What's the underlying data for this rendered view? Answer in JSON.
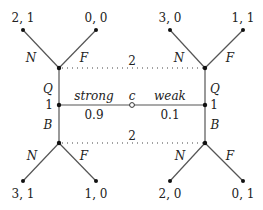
{
  "diagram": {
    "type": "extensive-form game tree",
    "nature": {
      "label": "c",
      "moves": [
        {
          "label": "strong",
          "probability": "0.9"
        },
        {
          "label": "weak",
          "probability": "0.1"
        }
      ]
    },
    "player1_nodes": [
      {
        "side": "left",
        "player": "1",
        "actions": [
          "Q",
          "B"
        ]
      },
      {
        "side": "right",
        "player": "1",
        "actions": [
          "Q",
          "B"
        ]
      }
    ],
    "information_sets": [
      {
        "player": "2",
        "position": "top",
        "after_action": "Q"
      },
      {
        "player": "2",
        "position": "bottom",
        "after_action": "B"
      }
    ],
    "player2_actions": [
      "N",
      "F"
    ],
    "payoffs": {
      "top_left": [
        "2, 1",
        "0, 0"
      ],
      "top_right": [
        "3, 0",
        "1, 1"
      ],
      "bottom_left": [
        "3, 1",
        "1, 0"
      ],
      "bottom_right": [
        "2, 0",
        "0, 1"
      ]
    },
    "labels": {
      "N": "N",
      "F": "F",
      "Q": "Q",
      "B": "B",
      "one": "1",
      "two": "2"
    }
  }
}
